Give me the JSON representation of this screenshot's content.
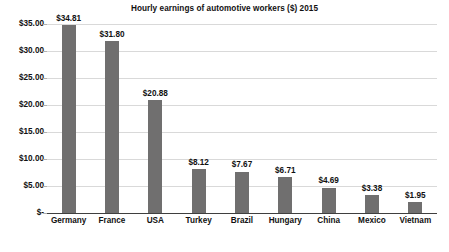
{
  "chart_data": {
    "type": "bar",
    "title": "Hourly earnings of automotive workers ($) 2015",
    "xlabel": "",
    "ylabel": "",
    "ylim": [
      0,
      35
    ],
    "grid": true,
    "legend": false,
    "categories": [
      "Germany",
      "France",
      "USA",
      "Turkey",
      "Brazil",
      "Hungary",
      "China",
      "Mexico",
      "Vietnam"
    ],
    "values": [
      34.81,
      31.8,
      20.88,
      8.12,
      7.67,
      6.71,
      4.69,
      3.38,
      1.95
    ],
    "data_labels": [
      "$34.81",
      "$31.80",
      "$20.88",
      "$8.12",
      "$7.67",
      "$6.71",
      "$4.69",
      "$3.38",
      "$1.95"
    ],
    "y_ticks": [
      0,
      5,
      10,
      15,
      20,
      25,
      30,
      35
    ],
    "y_tick_labels": [
      "$-",
      "$5.00",
      "$10.00",
      "$15.00",
      "$20.00",
      "$25.00",
      "$30.00",
      "$35.00"
    ],
    "bar_color": "#706F6F",
    "gridline_color": "#D9D9D9",
    "axis_color": "#3F3F3F",
    "text_color": "#111111",
    "background_color": "#FFFFFF"
  }
}
